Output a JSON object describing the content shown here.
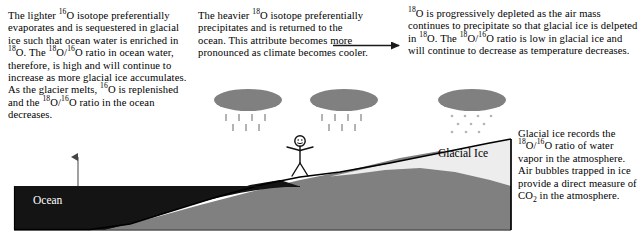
{
  "diagram": {
    "colors": {
      "ocean": "#141414",
      "land": "#808080",
      "glacial_ice": "#ededed",
      "cloud": "#808080",
      "outline": "#000000",
      "page_background": "#ffffff",
      "ocean_label_text": "#ffffff"
    }
  },
  "annotations": {
    "ocean_text": {
      "id": "ocean-enrichment-note",
      "lines": [
        "The lighter <sup>16</sup>O isotope",
        "preferentially evaporates and is",
        "sequestered in glacial ice such",
        "that ocean water is enriched in",
        "<sup>18</sup>O. The <sup>18</sup>O/<sup>16</sup>O ratio in ocean",
        "water, therefore, is high and will",
        "continue to increase as more",
        "glacial ice accumulates. As the",
        "glacier melts, <sup>16</sup>O is replenished",
        "and the <sup>18</sup>O/<sup>16</sup>O ratio in the ocean",
        "decreases."
      ],
      "plain_text": "The lighter 16O isotope preferentially evaporates and is sequestered in glacial ice such that ocean water is enriched in 18O. The 18O/16O ratio in ocean water, therefore, is high and will continue to increase as more glacial ice accumulates. As the glacier melts, 16O is replenished and the 18O/16O ratio in the ocean decreases."
    },
    "precipitation_text": {
      "id": "heavier-isotope-precipitation-note",
      "lines": [
        "The heavier <sup>18</sup>O isotope",
        "preferentially precipitates and",
        "is returned to the ocean. This",
        "attribute becomes more pronounced",
        "as climate becomes cooler."
      ],
      "plain_text": "The heavier 18O isotope preferentially precipitates and is returned to the ocean. This attribute becomes more pronounced as climate becomes cooler."
    },
    "depletion_text": {
      "id": "progressive-depletion-note",
      "lines": [
        "<sup>18</sup>O is progressively depleted as the air mass",
        "continues to precipitate so that glacial ice is",
        "delpeted in <sup>18</sup>O. The <sup>18</sup>O/<sup>16</sup>O ratio is low in",
        "glacial ice and will continue to decrease as",
        "temperature decreases."
      ],
      "plain_text": "18O is progressively depleted as the air mass continues to precipitate so that glacial ice is delpeted in 18O. The 18O/16O ratio is low in glacial ice and will continue to decrease as temperature decreases."
    },
    "ice_record_text": {
      "id": "glacial-ice-record-note",
      "lines": [
        "Glacial ice records the",
        "<sup>18</sup>O/<sup>16</sup>O ratio of water",
        "vapor in the atmosphere.",
        "Air bubbles trapped in",
        "ice provide a direct",
        "measure of CO<sub>2</sub> in the",
        "atmosphere."
      ],
      "plain_text": "Glacial ice records the 18O/16O ratio of water vapor in the atmosphere. Air bubbles trapped in ice provide a direct measure of CO2 in the atmosphere."
    }
  },
  "scene_labels": {
    "ocean": "Ocean",
    "glacial_ice": "Glacial Ice"
  },
  "scene_elements": {
    "clouds": [
      {
        "name": "cloud-left",
        "precipitation": "rain",
        "cx": 248,
        "cy": 101
      },
      {
        "name": "cloud-middle",
        "precipitation": "rain",
        "cx": 344,
        "cy": 101
      },
      {
        "name": "cloud-right",
        "precipitation": "snow",
        "cx": 472,
        "cy": 101
      }
    ],
    "figure": {
      "name": "stick-figure-observer",
      "x": 300,
      "y": 135
    },
    "connectors": [
      {
        "name": "arrow-ocean-to-note",
        "direction": "up",
        "from": "ocean",
        "to": "ocean-enrichment-note"
      },
      {
        "name": "arrow-precip-to-depletion",
        "direction": "right",
        "from": "precipitation-note",
        "to": "depletion-note"
      },
      {
        "name": "leader-line-glacier-to-record-note",
        "direction": "vertical",
        "from": "glacial-ice",
        "to": "glacial-ice-record-note"
      }
    ]
  }
}
